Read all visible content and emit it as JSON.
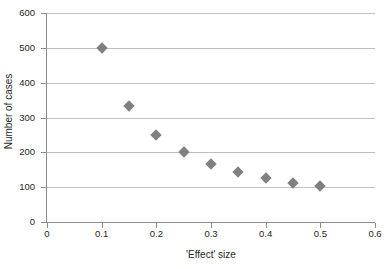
{
  "chart_data": {
    "type": "scatter",
    "title": "",
    "xlabel": "'Effect' size",
    "ylabel": "Number of cases",
    "xlim": [
      0,
      0.6
    ],
    "ylim": [
      0,
      600
    ],
    "xticks": [
      0,
      0.1,
      0.2,
      0.3,
      0.4,
      0.5,
      0.6
    ],
    "xtick_labels": [
      "0",
      "0.1",
      "0.2",
      "0.3",
      "0.4",
      "0.5",
      "0.6"
    ],
    "yticks": [
      0,
      100,
      200,
      300,
      400,
      500,
      600
    ],
    "ytick_labels": [
      "0",
      "100",
      "200",
      "300",
      "400",
      "500",
      "600"
    ],
    "grid": "horizontal",
    "legend": "none",
    "marker": "diamond",
    "marker_color": "#808080",
    "gridline_color": "#bfbfbf",
    "axis_color": "#8c8c8c",
    "background_color": "#ffffff",
    "x": [
      0.1,
      0.15,
      0.2,
      0.25,
      0.3,
      0.35,
      0.4,
      0.45,
      0.5
    ],
    "y": [
      500,
      333,
      250,
      202,
      167,
      143,
      125,
      112,
      102
    ],
    "points": [
      {
        "x": 0.1,
        "y": 500
      },
      {
        "x": 0.15,
        "y": 333
      },
      {
        "x": 0.2,
        "y": 250
      },
      {
        "x": 0.25,
        "y": 202
      },
      {
        "x": 0.3,
        "y": 167
      },
      {
        "x": 0.35,
        "y": 143
      },
      {
        "x": 0.4,
        "y": 125
      },
      {
        "x": 0.45,
        "y": 112
      },
      {
        "x": 0.5,
        "y": 102
      }
    ]
  }
}
